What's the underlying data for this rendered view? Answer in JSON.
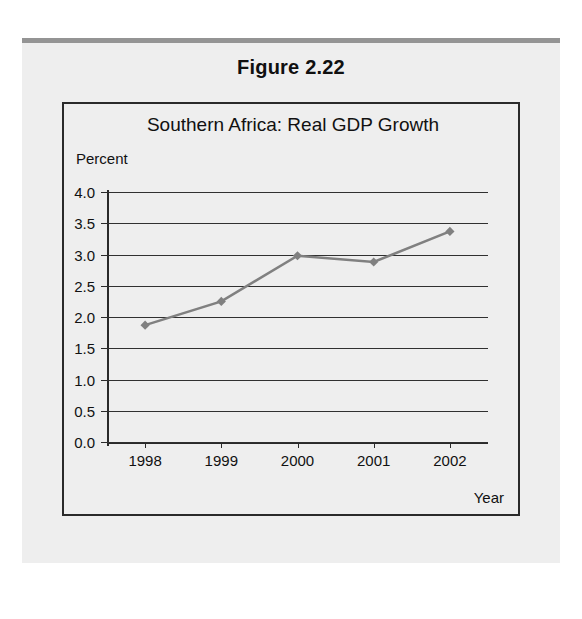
{
  "figure": {
    "caption": "Figure 2.22"
  },
  "chart_data": {
    "type": "line",
    "title": "Southern Africa: Real GDP Growth",
    "xlabel": "Year",
    "ylabel": "Percent",
    "categories": [
      "1998",
      "1999",
      "2000",
      "2001",
      "2002"
    ],
    "values": [
      1.87,
      2.25,
      2.98,
      2.88,
      3.37
    ],
    "series": [
      {
        "name": "Real GDP Growth",
        "values": [
          1.87,
          2.25,
          2.98,
          2.88,
          3.37
        ]
      }
    ],
    "ylim": [
      0.0,
      4.0
    ],
    "ytick_labels": [
      "4.0",
      "3.5",
      "3.0",
      "2.5",
      "2.0",
      "1.5",
      "1.0",
      "0.5",
      "0.0"
    ],
    "ytick_values": [
      4.0,
      3.5,
      3.0,
      2.5,
      2.0,
      1.5,
      1.0,
      0.5,
      0.0
    ],
    "grid": true,
    "legend": false,
    "legend_position": "none",
    "line_color": "#808080",
    "marker_color": "#808080",
    "marker_shape": "diamond",
    "gridline_color": "#303030",
    "axis_color": "#2a2a2a",
    "plot_background": "#eeeeee"
  }
}
